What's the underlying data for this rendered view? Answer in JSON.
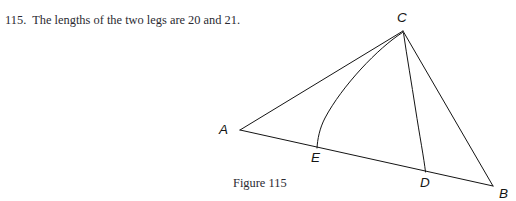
{
  "page": {
    "width": 516,
    "height": 201,
    "background": "#ffffff",
    "ink_color": "#1a1a1a",
    "clipped_top_line": "                                                  "
  },
  "problem": {
    "number": "115.",
    "text": "The lengths of the two legs are 20 and 21.",
    "full": "115.  The lengths of the two legs are 20 and 21."
  },
  "figure": {
    "caption": "Figure 115",
    "type": "geometry-diagram",
    "stroke_color": "#141414",
    "stroke_width": 1,
    "vertices": [
      {
        "id": "A",
        "label": "A",
        "x": 240,
        "y": 130,
        "label_x": 219,
        "label_y": 134
      },
      {
        "id": "C",
        "label": "C",
        "x": 403,
        "y": 31,
        "label_x": 397,
        "label_y": 22
      },
      {
        "id": "B",
        "label": "B",
        "x": 493,
        "y": 186,
        "label_x": 499,
        "label_y": 198
      },
      {
        "id": "E",
        "label": "E",
        "x": 317,
        "y": 148,
        "label_x": 311,
        "label_y": 162
      },
      {
        "id": "D",
        "label": "D",
        "x": 426,
        "y": 172,
        "label_x": 420,
        "label_y": 187
      }
    ],
    "segments": [
      {
        "name": "side-AC",
        "from": "A",
        "to": "C"
      },
      {
        "name": "side-AB",
        "from": "A",
        "to": "B"
      },
      {
        "name": "side-CB",
        "from": "C",
        "to": "B"
      }
    ],
    "arcs": [
      {
        "name": "arc-CE",
        "from": "C",
        "to": "E",
        "bulge": "right"
      },
      {
        "name": "arc-CD",
        "from": "C",
        "to": "D",
        "bulge": "left"
      }
    ],
    "paths": {
      "side_AC": "M 240 130 L 403 31",
      "side_AB": "M 240 130 L 493 186",
      "side_CB": "M 403 31 L 493 186",
      "arc_CE": "M 402.5 32.5 C 378 48 342 86 325 118 C 319.5 128.5 317.5 139 317 148",
      "arc_CD": "M 403.5 33 C 408 56 412 82 416 108 C 420 134 424 158 425.5 172"
    }
  }
}
